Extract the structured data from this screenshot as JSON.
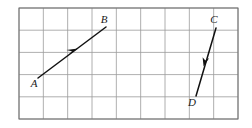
{
  "figure": {
    "background_color": "#ffffff",
    "grid": {
      "line_color": "#9a9a9a",
      "border_color": "#6e6e6e",
      "line_width": 0.8,
      "columns": 9,
      "rows": 5,
      "x_start": 19,
      "y_start": 8,
      "cell_width": 24.33,
      "cell_height": 22.2
    },
    "vectors": [
      {
        "id": "vector-ab",
        "from_label": "A",
        "to_label": "B",
        "from_point": [
          38,
          78
        ],
        "to_point": [
          106,
          27
        ],
        "color": "#111111",
        "stroke_width": 1.5,
        "arrow_at": [
          73,
          52
        ],
        "arrow_direction": "up-right",
        "from_label_pos": [
          34,
          87
        ],
        "to_label_pos": [
          104,
          23
        ]
      },
      {
        "id": "vector-cd",
        "from_label": "C",
        "to_label": "D",
        "from_point": [
          216,
          28
        ],
        "to_point": [
          196,
          96
        ],
        "color": "#111111",
        "stroke_width": 1.5,
        "arrow_at": [
          206,
          62
        ],
        "arrow_direction": "down-left",
        "from_label_pos": [
          214,
          23
        ],
        "to_label_pos": [
          192,
          106
        ]
      }
    ],
    "labels": [
      {
        "name": "label-a",
        "text": "A",
        "x": 34,
        "y": 87
      },
      {
        "name": "label-b",
        "text": "B",
        "x": 104,
        "y": 23
      },
      {
        "name": "label-c",
        "text": "C",
        "x": 214,
        "y": 23
      },
      {
        "name": "label-d",
        "text": "D",
        "x": 192,
        "y": 106
      }
    ]
  }
}
